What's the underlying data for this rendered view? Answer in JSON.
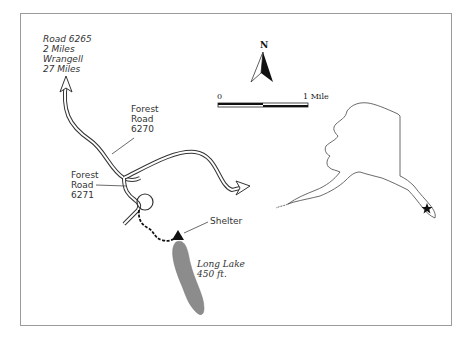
{
  "map": {
    "destination_label": {
      "line1": "Road 6265",
      "line2": "2 Miles",
      "line3": "Wrangell",
      "line4": "27 Miles"
    },
    "forest_road_6270": {
      "line1": "Forest",
      "line2": "Road",
      "line3": "6270"
    },
    "forest_road_6271": {
      "line1": "Forest",
      "line2": "Road",
      "line3": "6271"
    },
    "shelter_label": "Shelter",
    "lake_label": {
      "name": "Long Lake",
      "elevation": "450 ft."
    },
    "north_arrow_label": "N",
    "scale_bar": {
      "start": "0",
      "end": "1 Mile"
    },
    "inset": {
      "region": "Alaska",
      "marker": "star"
    },
    "colors": {
      "lake_fill": "#8c8c8c",
      "road_stroke": "#333333",
      "frame_border": "#9a9a9a"
    }
  }
}
